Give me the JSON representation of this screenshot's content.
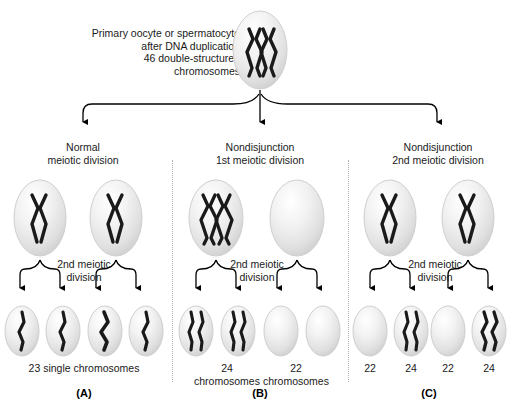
{
  "figure": {
    "title_text": "Primary oocyte or spermatocyte\nafter DNA duplication\n46 double-structured\nchromosomes",
    "columns": [
      {
        "letter": "(A)",
        "heading": "Normal\nmeiotic division",
        "stage2_label": "2nd meiotic\ndivision",
        "result_labels": [
          "23 single chromosomes"
        ],
        "parent_cells": [
          {
            "contents": "one-double-chromosome"
          },
          {
            "contents": "one-double-chromosome"
          }
        ],
        "daughter_cells": [
          {
            "contents": "one-single-chromosome"
          },
          {
            "contents": "one-single-chromosome"
          },
          {
            "contents": "one-single-chromosome"
          },
          {
            "contents": "one-single-chromosome"
          }
        ]
      },
      {
        "letter": "(B)",
        "heading": "Nondisjunction\n1st meiotic division",
        "stage2_label": "2nd meiotic\ndivision",
        "result_labels": [
          "24\nchromosomes",
          "22\nchromosomes"
        ],
        "parent_cells": [
          {
            "contents": "two-double-chromosomes"
          },
          {
            "contents": "empty"
          }
        ],
        "daughter_cells": [
          {
            "contents": "two-single-chromosomes"
          },
          {
            "contents": "two-single-chromosomes"
          },
          {
            "contents": "empty"
          },
          {
            "contents": "empty"
          }
        ]
      },
      {
        "letter": "(C)",
        "heading": "Nondisjunction\n2nd meiotic division",
        "stage2_label": "2nd meiotic\ndivision",
        "result_labels": [
          "22",
          "24",
          "22",
          "24"
        ],
        "parent_cells": [
          {
            "contents": "one-double-chromosome"
          },
          {
            "contents": "one-double-chromosome"
          }
        ],
        "daughter_cells": [
          {
            "contents": "empty"
          },
          {
            "contents": "two-single-chromosomes"
          },
          {
            "contents": "empty"
          },
          {
            "contents": "two-single-chromosomes"
          }
        ]
      }
    ],
    "colors": {
      "chromosome": "#1a1a1a",
      "cell_fill": "#e8e8e8",
      "cell_edge": "#cfcfcf",
      "arrow": "#000000",
      "divider": "#b4b4b4",
      "text": "#1a1a1a"
    }
  }
}
